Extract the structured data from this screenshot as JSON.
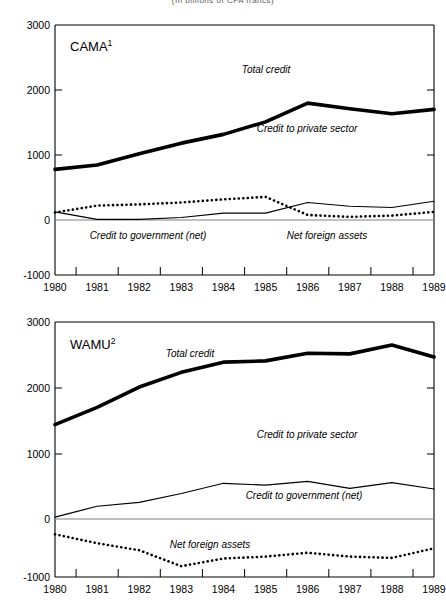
{
  "figure": {
    "title": "(In billions of CFA francs)",
    "width": 446,
    "height": 607
  },
  "panels": [
    {
      "id": "cama",
      "label": "CAMA",
      "label_superscript": "1",
      "annotations": {
        "total_credit": "Total credit",
        "credit_private": "Credit to private sector",
        "credit_government": "Credit to government (net)",
        "net_foreign_assets": "Net foreign assets"
      }
    },
    {
      "id": "wamu",
      "label": "WAMU",
      "label_superscript": "2",
      "annotations": {
        "total_credit": "Total credit",
        "credit_private": "Credit to private sector",
        "credit_government": "Credit to government (net)",
        "net_foreign_assets": "Net foreign assets"
      }
    }
  ],
  "axis": {
    "y_ticks": [
      "3000",
      "2000",
      "1000",
      "0",
      "-1000"
    ],
    "x_ticks": [
      "1980",
      "1981",
      "1982",
      "1983",
      "1984",
      "1985",
      "1986",
      "1987",
      "1988",
      "1989"
    ]
  },
  "colors": {
    "line": "#000000",
    "axis": "#000000",
    "zero_line": "#808080",
    "background": "#ffffff"
  },
  "chart_data": [
    {
      "type": "line",
      "title": "CAMA",
      "subtitle": "CAMA¹",
      "xlabel": "",
      "ylabel": "",
      "xlim": [
        1980,
        1989
      ],
      "ylim": [
        -1000,
        3000
      ],
      "yticks": [
        -1000,
        0,
        1000,
        2000,
        3000
      ],
      "grid": false,
      "legend": "inline-annotations",
      "x": [
        1980,
        1981,
        1982,
        1983,
        1984,
        1985,
        1986,
        1987,
        1988,
        1989
      ],
      "series": [
        {
          "name": "Total credit",
          "style": "thick-solid",
          "values": [
            690,
            760,
            940,
            1110,
            1250,
            1450,
            1750,
            1660,
            1580,
            1650
          ]
        },
        {
          "name": "Credit to government (net)",
          "style": "thin-solid",
          "values": [
            10,
            -110,
            -110,
            -80,
            -10,
            -10,
            160,
            100,
            80,
            180
          ]
        },
        {
          "name": "Net foreign assets",
          "style": "dotted",
          "values": [
            0,
            110,
            130,
            160,
            210,
            250,
            -40,
            -70,
            -50,
            10
          ]
        }
      ],
      "annotations": [
        {
          "text": "Total credit",
          "x": 1985.0,
          "y": 1930
        },
        {
          "text": "Credit to private sector",
          "x": 1986.0,
          "y": 1020
        },
        {
          "text": "Credit to government (net)",
          "x": 1982.2,
          "y": -280
        },
        {
          "text": "Net foreign assets",
          "x": 1986.9,
          "y": -280
        }
      ]
    },
    {
      "type": "line",
      "title": "WAMU",
      "subtitle": "WAMU²",
      "xlabel": "",
      "ylabel": "",
      "xlim": [
        1980,
        1989
      ],
      "ylim": [
        -1000,
        3000
      ],
      "yticks": [
        -1000,
        0,
        1000,
        2000,
        3000
      ],
      "grid": false,
      "legend": "inline-annotations",
      "x": [
        1980,
        1981,
        1982,
        1983,
        1984,
        1985,
        1986,
        1987,
        1988,
        1989
      ],
      "series": [
        {
          "name": "Total credit",
          "style": "thick-solid",
          "values": [
            1390,
            1660,
            1980,
            2210,
            2370,
            2390,
            2510,
            2500,
            2640,
            2450
          ]
        },
        {
          "name": "Credit to government (net)",
          "style": "thin-solid",
          "values": [
            -60,
            110,
            170,
            310,
            470,
            440,
            500,
            390,
            480,
            380
          ]
        },
        {
          "name": "Net foreign assets",
          "style": "dotted",
          "values": [
            -330,
            -470,
            -580,
            -830,
            -710,
            -680,
            -620,
            -680,
            -700,
            -550
          ]
        }
      ],
      "annotations": [
        {
          "text": "Total credit",
          "x": 1983.2,
          "y": 2660
        },
        {
          "text": "Credit to private sector",
          "x": 1985.9,
          "y": 1420
        },
        {
          "text": "Credit to government (net)",
          "x": 1985.9,
          "y": 300
        },
        {
          "text": "Net foreign assets",
          "x": 1983.7,
          "y": -450
        }
      ]
    }
  ]
}
